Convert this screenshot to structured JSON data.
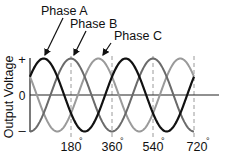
{
  "chart_data": {
    "type": "line",
    "title": "",
    "xlabel": "",
    "ylabel": "Output Voltage",
    "x_unit": "degrees",
    "x_range": [
      0,
      720
    ],
    "y_range": [
      -1,
      1
    ],
    "x_ticks": [
      {
        "value": 180,
        "label": "180°"
      },
      {
        "value": 360,
        "label": "360°"
      },
      {
        "value": 540,
        "label": "540°"
      },
      {
        "value": 720,
        "label": "720°"
      }
    ],
    "y_ticks": [
      {
        "value": 1,
        "label": "+"
      },
      {
        "value": 0,
        "label": "0"
      },
      {
        "value": -1,
        "label": "–"
      }
    ],
    "grid": {
      "vertical_dashed_at": [
        180,
        360,
        540,
        720
      ]
    },
    "series": [
      {
        "name": "Phase A",
        "color": "#111111",
        "stroke_width": 2.2,
        "formula": "cos(theta - 60)",
        "phase_peak_deg": 60,
        "x": [
          0,
          60,
          150,
          240,
          330,
          420,
          510,
          600,
          690,
          720
        ],
        "values": [
          0.5,
          1,
          0,
          -1,
          0,
          1,
          0,
          -1,
          0,
          0.5
        ]
      },
      {
        "name": "Phase B",
        "color": "#6a6a6a",
        "stroke_width": 2,
        "formula": "cos(theta - 180)",
        "phase_peak_deg": 180,
        "x": [
          0,
          90,
          180,
          270,
          360,
          450,
          540,
          630,
          720
        ],
        "values": [
          -1,
          0,
          1,
          0,
          -1,
          0,
          1,
          0,
          -1
        ]
      },
      {
        "name": "Phase C",
        "color": "#9a9a9a",
        "stroke_width": 2,
        "formula": "cos(theta - 300)",
        "phase_peak_deg": 300,
        "x": [
          0,
          30,
          120,
          210,
          300,
          390,
          480,
          570,
          660,
          720
        ],
        "values": [
          0.5,
          0,
          -1,
          0,
          1,
          0,
          -1,
          0,
          1,
          0.5
        ]
      }
    ],
    "annotations": [
      {
        "text": "Phase A",
        "points_to_series": "Phase A"
      },
      {
        "text": "Phase B",
        "points_to_series": "Phase B"
      },
      {
        "text": "Phase C",
        "points_to_series": "Phase C"
      }
    ]
  },
  "labels": {
    "ylabel": "Output Voltage",
    "plus": "+",
    "zero": "0",
    "minus": "–",
    "tick180": "180",
    "tick360": "360",
    "tick540": "540",
    "tick720": "720",
    "degree": "°",
    "phaseA": "Phase A",
    "phaseB": "Phase B",
    "phaseC": "Phase C"
  }
}
